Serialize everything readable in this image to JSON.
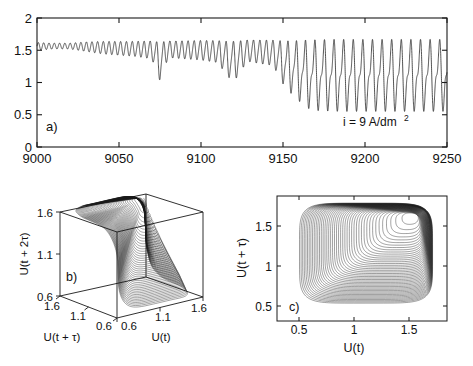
{
  "figure": {
    "background_color": "#ffffff",
    "line_color": "#1a1a1a",
    "axis_color": "#1a1a1a"
  },
  "chart_data": [
    {
      "id": "panel-a",
      "type": "line",
      "panel_label": "a)",
      "title": "",
      "xlabel": "",
      "ylabel": "",
      "xlim": [
        9000,
        9250
      ],
      "ylim": [
        0,
        2
      ],
      "xticks": [
        9000,
        9050,
        9100,
        9150,
        9200,
        9250
      ],
      "xticklabels": [
        "9000",
        "9050",
        "9100",
        "9150",
        "9200",
        "9250"
      ],
      "yticks": [
        0,
        0.5,
        1,
        1.5,
        2
      ],
      "yticklabels": [
        "0",
        "0.5",
        "1",
        "1.5",
        "2"
      ],
      "grid": false,
      "legend": null,
      "annotations": [
        {
          "text": "i = 9 A/dm2",
          "text_display": "i = 9 A/dm",
          "superscript": "2",
          "x": 9205,
          "y": 0.35
        }
      ],
      "description": "Potential oscillation time series U(t) versus time showing period-doubling / intermittent growth of amplitude from small oscillations near 1.55 to a large amplitude limit cycle between about 0.5 and 1.7",
      "series": [
        {
          "name": "U(t)",
          "mean_level_start": 1.57,
          "amplitude_start": 0.06,
          "amplitude_end": 1.2,
          "upper_envelope": [
            [
              9000,
              1.62
            ],
            [
              9010,
              1.61
            ],
            [
              9020,
              1.61
            ],
            [
              9030,
              1.63
            ],
            [
              9040,
              1.64
            ],
            [
              9055,
              1.64
            ],
            [
              9070,
              1.65
            ],
            [
              9085,
              1.65
            ],
            [
              9100,
              1.66
            ],
            [
              9115,
              1.66
            ],
            [
              9130,
              1.67
            ],
            [
              9145,
              1.67
            ],
            [
              9155,
              1.68
            ],
            [
              9165,
              1.7
            ],
            [
              9180,
              1.71
            ],
            [
              9200,
              1.71
            ],
            [
              9225,
              1.71
            ],
            [
              9250,
              1.71
            ]
          ],
          "lower_envelope": [
            [
              9000,
              1.5
            ],
            [
              9010,
              1.52
            ],
            [
              9020,
              1.52
            ],
            [
              9030,
              1.48
            ],
            [
              9040,
              1.44
            ],
            [
              9050,
              1.42
            ],
            [
              9060,
              1.4
            ],
            [
              9070,
              1.36
            ],
            [
              9075,
              1.0
            ],
            [
              9080,
              1.38
            ],
            [
              9090,
              1.36
            ],
            [
              9100,
              1.34
            ],
            [
              9110,
              1.3
            ],
            [
              9118,
              1.02
            ],
            [
              9122,
              1.05
            ],
            [
              9128,
              1.32
            ],
            [
              9136,
              1.28
            ],
            [
              9144,
              1.25
            ],
            [
              9150,
              0.95
            ],
            [
              9154,
              0.82
            ],
            [
              9158,
              0.72
            ],
            [
              9162,
              0.62
            ],
            [
              9166,
              0.55
            ],
            [
              9172,
              0.52
            ],
            [
              9185,
              0.51
            ],
            [
              9200,
              0.51
            ],
            [
              9225,
              0.51
            ],
            [
              9250,
              0.51
            ]
          ],
          "period_start": 3.2,
          "period_end": 6.0,
          "notes": "Quasi-periodic small oscillations for t<9035, growing oscillation amplitude with intermittent deep minima near t=9075, 9118 and 9150, then a rapid transition near t=9150-9170 into a steady large-amplitude relaxation oscillation."
        }
      ]
    },
    {
      "id": "panel-b",
      "type": "scatter",
      "plot_style": "3d-phase-portrait",
      "panel_label": "b)",
      "xlabel": "U(t)",
      "ylabel": "U(t + τ)",
      "zlabel": "U(t + 2τ)",
      "xlim": [
        0.6,
        1.6
      ],
      "ylim": [
        0.6,
        1.6
      ],
      "zlim": [
        0.6,
        1.6
      ],
      "xticks": [
        0.6,
        1.1,
        1.6
      ],
      "xticklabels": [
        "0.6",
        "1.1",
        "1.6"
      ],
      "yticks": [
        0.6,
        1.1,
        1.6
      ],
      "yticklabels": [
        "0.6",
        "1.1",
        "1.6"
      ],
      "zticks": [
        0.6,
        1.1,
        1.6
      ],
      "zticklabels": [
        "0.6",
        "1.1",
        "1.6"
      ],
      "grid": false,
      "legend": null,
      "description": "Three dimensional delay embedding of the time series forming a twisted funnel shaped attractor; dense dark core near the upper region around (1.5, 1.5, 1.5) unwinding to a broad ribbon reaching down toward (1.6, 0.6, 0.6)",
      "trajectory_turns": 44,
      "focus_point": [
        1.52,
        1.52,
        1.52
      ]
    },
    {
      "id": "panel-c",
      "type": "scatter",
      "plot_style": "2d-phase-portrait",
      "panel_label": "c)",
      "xlabel": "U(t)",
      "ylabel": "U(t + τ)",
      "xlim": [
        0.3,
        1.85
      ],
      "ylim": [
        0.3,
        1.8
      ],
      "xticks": [
        0.5,
        1,
        1.5
      ],
      "xticklabels": [
        "0.5",
        "1",
        "1.5"
      ],
      "yticks": [
        0.5,
        1,
        1.5
      ],
      "yticklabels": [
        "0.5",
        "1",
        "1.5"
      ],
      "grid": false,
      "legend": null,
      "description": "Two dimensional delay embedding U(t) versus U(t + tau) showing an outward spiral from a dense focus near (1.55, 1.55) growing into a large rounded square limit cycle spanning roughly 0.5 to 1.72 in both coordinates",
      "focus_point": [
        1.55,
        1.55
      ],
      "limit_cycle_bounds": {
        "xmin": 0.5,
        "xmax": 1.72,
        "ymin": 0.5,
        "ymax": 1.72
      },
      "spiral_turns": 44
    }
  ]
}
